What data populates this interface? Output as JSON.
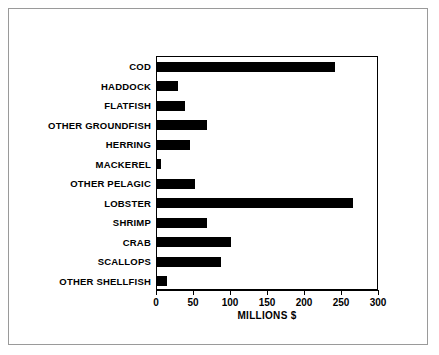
{
  "chart_data": {
    "type": "bar",
    "orientation": "horizontal",
    "title": "",
    "xlabel": "MILLIONS $",
    "ylabel": "",
    "xlim": [
      0,
      300
    ],
    "xticks": [
      0,
      50,
      100,
      150,
      200,
      250,
      300
    ],
    "xtick_labels": [
      "0",
      "50",
      "100",
      "150",
      "200",
      "250",
      "300"
    ],
    "grid": false,
    "legend": null,
    "bar_color": "#000000",
    "categories": [
      "COD",
      "HADDOCK",
      "FLATFISH",
      "OTHER GROUNDFISH",
      "HERRING",
      "MACKEREL",
      "OTHER PELAGIC",
      "LOBSTER",
      "SHRIMP",
      "CRAB",
      "SCALLOPS",
      "OTHER SHELLFISH"
    ],
    "values": [
      240,
      28,
      38,
      67,
      45,
      5,
      52,
      265,
      68,
      100,
      86,
      14
    ]
  },
  "colors": {
    "frame": "#9a9a9a",
    "axis": "#000000",
    "background": "#ffffff"
  }
}
